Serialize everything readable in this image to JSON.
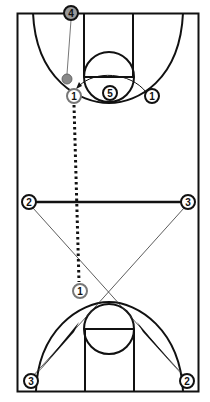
{
  "diagram": {
    "type": "basketball-play",
    "court": {
      "colors": {
        "line": "#111111",
        "background": "#ffffff"
      }
    },
    "players": {
      "p4_top": {
        "label": "4"
      },
      "p1_top": {
        "label": "1"
      },
      "p5_top": {
        "label": "5"
      },
      "p1_right": {
        "label": "1"
      },
      "p2_mid": {
        "label": "2"
      },
      "p3_mid": {
        "label": "3"
      },
      "p1_low": {
        "label": "1"
      },
      "p3_bottom": {
        "label": "3"
      },
      "p2_bottom": {
        "label": "2"
      }
    },
    "actions": {
      "pass_4_to_1": "pass",
      "cut_1_right_arc": "cut",
      "dribble_1": "dribble",
      "pass_2_3": "pass",
      "cut_2_to_bottom_right": "cut",
      "cut_3_to_bottom_left": "cut"
    }
  }
}
